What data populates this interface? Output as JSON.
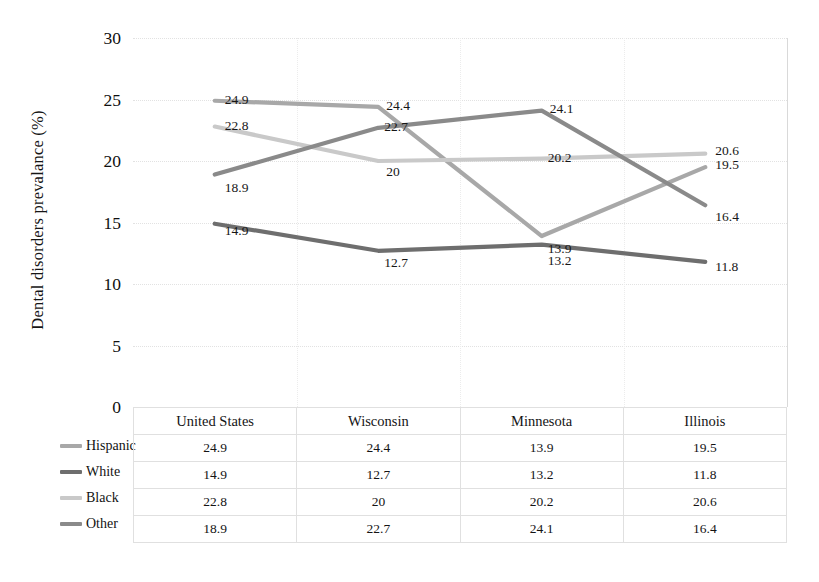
{
  "axis": {
    "y_title": "Dental disorders prevalance (%)",
    "y_ticks": [
      "30",
      "25",
      "20",
      "15",
      "10",
      "5",
      "0"
    ]
  },
  "table": {
    "columns": [
      "United States",
      "Wisconsin",
      "Minnesota",
      "Illinois"
    ],
    "rows": [
      {
        "label": "Hispanic",
        "color": "#a8a8a8",
        "values": [
          "24.9",
          "24.4",
          "13.9",
          "19.5"
        ]
      },
      {
        "label": "White",
        "color": "#6e6e6e",
        "values": [
          "14.9",
          "12.7",
          "13.2",
          "11.8"
        ]
      },
      {
        "label": "Black",
        "color": "#c9c9c9",
        "values": [
          "22.8",
          "20",
          "20.2",
          "20.6"
        ]
      },
      {
        "label": "Other",
        "color": "#8a8a8a",
        "values": [
          "18.9",
          "22.7",
          "24.1",
          "16.4"
        ]
      }
    ]
  },
  "point_labels": {
    "hispanic": [
      "24.9",
      "24.4",
      "13.9",
      "19.5"
    ],
    "white": [
      "14.9",
      "12.7",
      "13.2",
      "11.8"
    ],
    "black": [
      "22.8",
      "20",
      "20.2",
      "20.6"
    ],
    "other": [
      "18.9",
      "22.7",
      "24.1",
      "16.4"
    ]
  },
  "chart_data": {
    "type": "line",
    "title": "",
    "xlabel": "",
    "ylabel": "Dental disorders prevalance (%)",
    "categories": [
      "United States",
      "Wisconsin",
      "Minnesota",
      "Illinois"
    ],
    "series": [
      {
        "name": "Hispanic",
        "values": [
          24.9,
          24.4,
          13.9,
          19.5
        ],
        "color": "#a8a8a8"
      },
      {
        "name": "White",
        "values": [
          14.9,
          12.7,
          13.2,
          11.8
        ],
        "color": "#6e6e6e"
      },
      {
        "name": "Black",
        "values": [
          22.8,
          20.0,
          20.2,
          20.6
        ],
        "color": "#c9c9c9"
      },
      {
        "name": "Other",
        "values": [
          18.9,
          22.7,
          24.1,
          16.4
        ],
        "color": "#8a8a8a"
      }
    ],
    "ylim": [
      0,
      30
    ],
    "ytick_step": 5,
    "grid": true,
    "legend_position": "data-table-left",
    "data_table_shown": true,
    "data_labels_shown": true
  }
}
